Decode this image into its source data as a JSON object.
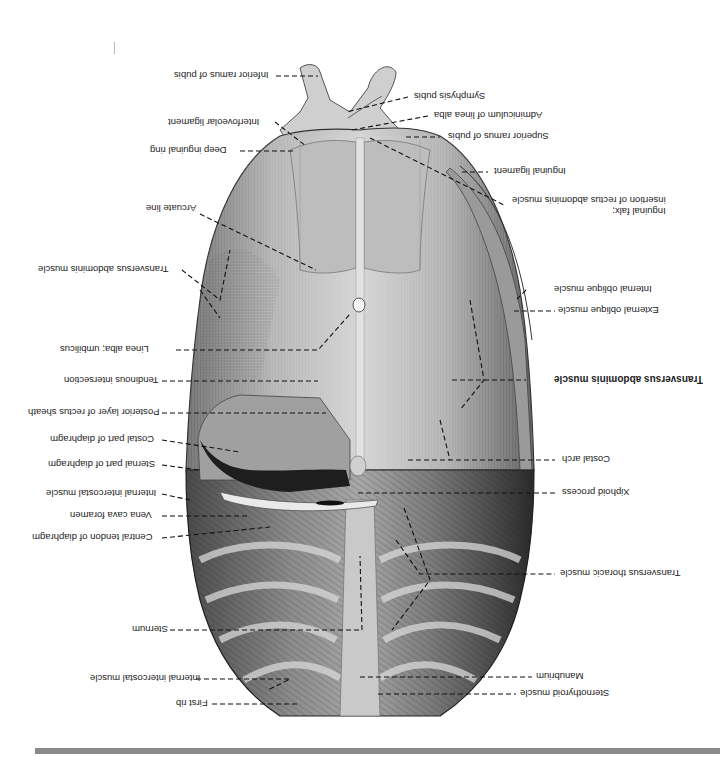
{
  "figure": {
    "orientation": "rotated 180 degrees",
    "colors": {
      "background": "#ffffff",
      "muscle_light": "#d9d9d9",
      "muscle_mid": "#a8a8a8",
      "muscle_dark": "#5a5a5a",
      "shadow": "#1e1e1e",
      "bottom_bar": "#8a8a8a",
      "leader_line": "#111111"
    }
  },
  "labels_left": [
    {
      "id": "inferior-ramus-of-pubis",
      "text": "Inferior ramus of pubis"
    },
    {
      "id": "interfoveolar-ligament",
      "text": "Interfoveolar ligament"
    },
    {
      "id": "deep-inguinal-ring",
      "text": "Deep inguinal ring"
    },
    {
      "id": "arcuate-line",
      "text": "Arcuate line"
    },
    {
      "id": "transversus-abdominis-muscle-left",
      "text": "Transversus abdominis muscle"
    },
    {
      "id": "linea-alba-umbilicus",
      "text": "Linea alba; umbilicus"
    },
    {
      "id": "tendinous-intersection",
      "text": "Tendinous intersection"
    },
    {
      "id": "posterior-layer-of-rectus-sheath",
      "text": "Posterior layer of rectus sheath"
    },
    {
      "id": "costal-part-of-diaphragm",
      "text": "Costal part of diaphragm"
    },
    {
      "id": "sternal-part-of-diaphragm",
      "text": "Sternal part of diaphragm"
    },
    {
      "id": "internal-intercostal-muscle-upper",
      "text": "Internal intercostal muscle"
    },
    {
      "id": "vena-cava-foramen",
      "text": "Vena cava foramen"
    },
    {
      "id": "central-tendon-of-diaphragm",
      "text": "Central tendon of diaphragm"
    },
    {
      "id": "sternum",
      "text": "Sternum"
    },
    {
      "id": "internal-intercostal-muscle-lower",
      "text": "Internal intercostal muscle"
    },
    {
      "id": "first-rib",
      "text": "First rib"
    }
  ],
  "labels_right": [
    {
      "id": "symphysis-pubis",
      "text": "Symphysis pubis"
    },
    {
      "id": "adminiculum-of-linea-alba",
      "text": "Adminiculum of linea alba"
    },
    {
      "id": "superior-ramus-of-pubis",
      "text": "Superior ramus of pubis"
    },
    {
      "id": "inguinal-ligament",
      "text": "Inguinal ligament"
    },
    {
      "id": "inguinal-falx",
      "text": "Inguinal falx;\ninsertion of rectus abdominis muscle"
    },
    {
      "id": "internal-oblique-muscle",
      "text": "Internal oblique muscle"
    },
    {
      "id": "external-oblique-muscle",
      "text": "External oblique muscle"
    },
    {
      "id": "transversus-abdominis-muscle-right",
      "text": "Transversus abdominis muscle",
      "bold": true
    },
    {
      "id": "costal-arch",
      "text": "Costal arch"
    },
    {
      "id": "xiphoid-process",
      "text": "Xiphoid process"
    },
    {
      "id": "transversus-thoracic-muscle",
      "text": "Transversus thoracic muscle"
    },
    {
      "id": "manubrium",
      "text": "Manubrium"
    },
    {
      "id": "sternothyroid-muscle",
      "text": "Sternothyroid muscle"
    }
  ]
}
